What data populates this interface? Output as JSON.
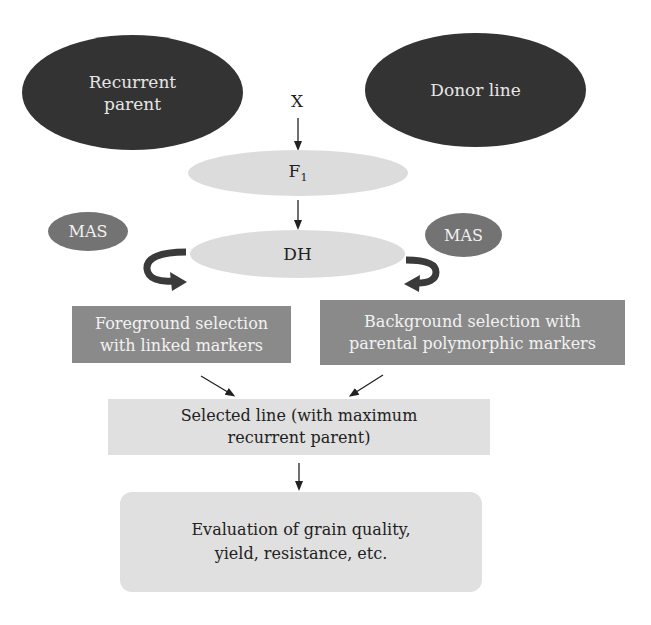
{
  "diagram": {
    "nodes": {
      "recurrent_parent": {
        "line1": "Recurrent",
        "line2": "parent"
      },
      "donor_line": {
        "label": "Donor line"
      },
      "cross": {
        "label": "X"
      },
      "f1": {
        "label": "F",
        "subscript": "1"
      },
      "dh": {
        "label": "DH"
      },
      "mas_left": {
        "label": "MAS"
      },
      "mas_right": {
        "label": "MAS"
      },
      "foreground_selection": {
        "line1": "Foreground selection",
        "line2": "with linked markers"
      },
      "background_selection": {
        "line1": "Background selection with",
        "line2": "parental polymorphic markers"
      },
      "selected_line": {
        "line1": "Selected line (with maximum",
        "line2": "recurrent parent)"
      },
      "evaluation": {
        "line1": "Evaluation of grain quality,",
        "line2": "yield, resistance, etc."
      }
    },
    "edges": [
      {
        "from": "cross",
        "to": "f1"
      },
      {
        "from": "f1",
        "to": "dh"
      },
      {
        "from": "dh",
        "to": "foreground_selection",
        "style": "curved"
      },
      {
        "from": "dh",
        "to": "background_selection",
        "style": "curved"
      },
      {
        "from": "foreground_selection",
        "to": "selected_line"
      },
      {
        "from": "background_selection",
        "to": "selected_line"
      },
      {
        "from": "selected_line",
        "to": "evaluation"
      }
    ],
    "colors": {
      "dark_node": "#333333",
      "mas_node": "#737373",
      "selection_box": "#8a8a8a",
      "light_node": "#dcdcdc",
      "arrow": "#222222",
      "curved_arrow": "#3a3a3a"
    }
  }
}
